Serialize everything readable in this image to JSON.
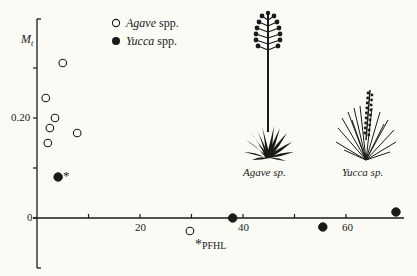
{
  "chart_data": {
    "type": "scatter",
    "title": "",
    "xlabel": "",
    "ylabel": "M_t",
    "ylabel_main": "M",
    "ylabel_sub": "t",
    "xlim": [
      0,
      71
    ],
    "ylim": [
      -0.1,
      0.4
    ],
    "grid": false,
    "legend_position": "upper-left-inside",
    "x_tick_labels": [
      {
        "value": 20,
        "label": "20"
      },
      {
        "value": 40,
        "label": "40"
      },
      {
        "value": 60,
        "label": "60"
      }
    ],
    "x_ticks": [
      10,
      20,
      30,
      40,
      50,
      60
    ],
    "y_tick_labels": [
      {
        "value": 0,
        "label": "0"
      },
      {
        "value": 0.2,
        "label": "0.20"
      }
    ],
    "y_ticks": [
      0,
      0.1,
      0.2,
      0.3
    ],
    "series": [
      {
        "name": "Agave spp.",
        "name_genus": "Agave",
        "name_suffix": " spp.",
        "marker": "open-circle",
        "points": [
          {
            "x": 5.0,
            "y": 0.31
          },
          {
            "x": 1.7,
            "y": 0.24
          },
          {
            "x": 3.5,
            "y": 0.2
          },
          {
            "x": 2.5,
            "y": 0.18
          },
          {
            "x": 7.8,
            "y": 0.17
          },
          {
            "x": 2.1,
            "y": 0.15
          },
          {
            "x": 29.7,
            "y": -0.026,
            "annotation": "*PFHL"
          }
        ]
      },
      {
        "name": "Yucca spp.",
        "name_genus": "Yucca",
        "name_suffix": " spp.",
        "marker": "filled-circle",
        "points": [
          {
            "x": 4.1,
            "y": 0.082,
            "annotation": "*"
          },
          {
            "x": 38.0,
            "y": 0.0
          },
          {
            "x": 55.5,
            "y": -0.018
          },
          {
            "x": 69.7,
            "y": 0.012
          }
        ]
      }
    ],
    "annotations": [
      {
        "text": "*",
        "near": "Yucca point at x=4.1"
      },
      {
        "text": "*PFHL",
        "near": "Agave point at x=29.7"
      }
    ],
    "illustrations": [
      {
        "name": "agave-plant",
        "caption": "Agave sp."
      },
      {
        "name": "yucca-plant",
        "caption": "Yucca sp."
      }
    ]
  },
  "labels": {
    "ylabel_main": "M",
    "ylabel_sub": "t",
    "y0": "0",
    "y20": "0.20",
    "x20": "20",
    "x40": "40",
    "x60": "60",
    "legend_agave_genus": "Agave",
    "legend_agave_suffix": " spp.",
    "legend_yucca_genus": "Yucca",
    "legend_yucca_suffix": " spp.",
    "asterisk": "*",
    "pfhl": "PFHL",
    "caption_agave": "Agave sp.",
    "caption_yucca": "Yucca sp."
  }
}
